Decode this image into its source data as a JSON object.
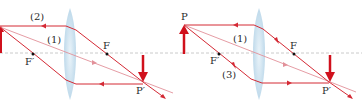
{
  "diagrams": [
    {
      "id": "left",
      "labels": {
        "ray2": "(2)",
        "ray1": "(1)",
        "focus": "F",
        "focus_prime": "F′",
        "image_point": "P′"
      }
    },
    {
      "id": "right",
      "labels": {
        "object_point": "P",
        "ray1": "(1)",
        "ray3": "(3)",
        "focus": "F",
        "focus_prime": "F′",
        "image_point": "P′"
      }
    }
  ],
  "colors": {
    "ray": "#d42a35",
    "ray_light": "#e2919a",
    "arrow": "#d0101c",
    "axis": "#b9b9b9",
    "lens": "#b9d7ea",
    "text": "#2a2a2a"
  }
}
